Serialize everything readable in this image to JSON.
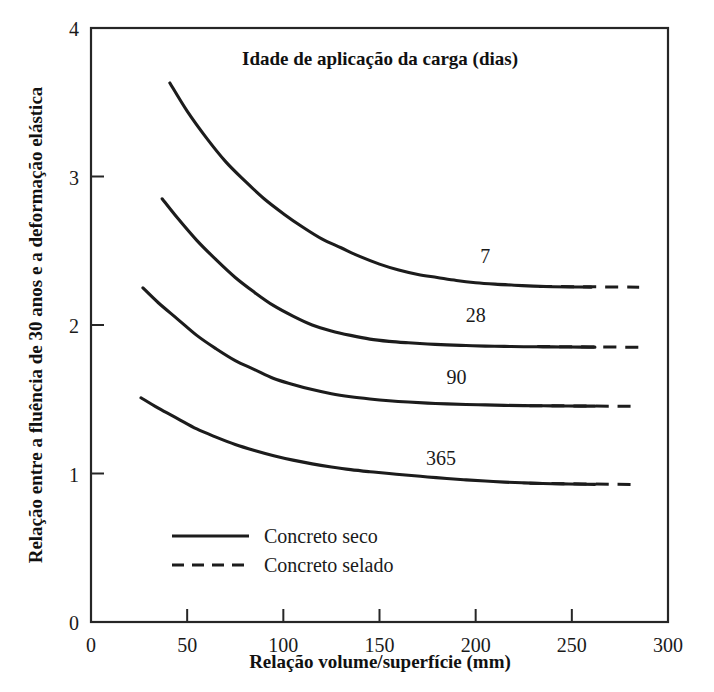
{
  "chart_data": {
    "type": "line",
    "title": "Idade de aplicação da carga (dias)",
    "xlabel": "Relação volume/superfície (mm)",
    "ylabel": "Relação entre a fluência de 30 anos e a deformação elástica",
    "xlim": [
      0,
      300
    ],
    "ylim": [
      0,
      4
    ],
    "xticks": [
      0,
      50,
      100,
      150,
      200,
      250,
      300
    ],
    "xticklabels": [
      "0",
      "50",
      "100",
      "150",
      "200",
      "250",
      "300"
    ],
    "yticks": [
      0,
      1,
      2,
      3,
      4
    ],
    "yticklabels": [
      "0",
      "1",
      "2",
      "3",
      "4"
    ],
    "grid": false,
    "legend_position": "lower-left-inside",
    "legend": [
      {
        "label": "Concreto seco",
        "style": "solid"
      },
      {
        "label": "Concreto selado",
        "style": "dashed"
      }
    ],
    "series": [
      {
        "name": "7",
        "label": "7",
        "label_x": 205,
        "label_y": 2.42,
        "style": "solid-then-dashed",
        "solid_x": [
          41,
          50,
          60,
          70,
          80,
          90,
          100,
          110,
          120,
          130,
          140,
          150,
          160,
          170,
          180,
          190,
          200,
          210,
          220,
          230,
          240,
          250,
          260
        ],
        "solid_y": [
          3.63,
          3.44,
          3.26,
          3.1,
          2.97,
          2.85,
          2.75,
          2.66,
          2.58,
          2.52,
          2.46,
          2.41,
          2.37,
          2.34,
          2.32,
          2.3,
          2.285,
          2.275,
          2.268,
          2.262,
          2.258,
          2.256,
          2.255
        ],
        "dashed_x": [
          233,
          285
        ],
        "dashed_y": [
          2.26,
          2.255
        ]
      },
      {
        "name": "28",
        "label": "28",
        "label_x": 200,
        "label_y": 2.02,
        "style": "solid-then-dashed",
        "solid_x": [
          37,
          45,
          55,
          65,
          75,
          85,
          95,
          105,
          115,
          125,
          135,
          145,
          155,
          165,
          175,
          185,
          195,
          205,
          215,
          225,
          235,
          245,
          255,
          262
        ],
        "solid_y": [
          2.85,
          2.72,
          2.57,
          2.44,
          2.32,
          2.22,
          2.13,
          2.06,
          2.0,
          1.96,
          1.93,
          1.905,
          1.89,
          1.88,
          1.872,
          1.866,
          1.862,
          1.858,
          1.856,
          1.854,
          1.853,
          1.852,
          1.851,
          1.851
        ],
        "dashed_x": [
          232,
          286
        ],
        "dashed_y": [
          1.855,
          1.85
        ]
      },
      {
        "name": "90",
        "label": "90",
        "label_x": 190,
        "label_y": 1.6,
        "style": "solid-then-dashed",
        "solid_x": [
          27,
          35,
          45,
          55,
          65,
          75,
          85,
          95,
          105,
          115,
          125,
          135,
          145,
          155,
          165,
          175,
          185,
          195,
          205,
          215,
          225,
          235,
          245,
          255,
          262
        ],
        "solid_y": [
          2.25,
          2.15,
          2.04,
          1.93,
          1.84,
          1.76,
          1.7,
          1.64,
          1.6,
          1.565,
          1.537,
          1.517,
          1.502,
          1.49,
          1.481,
          1.474,
          1.469,
          1.465,
          1.462,
          1.459,
          1.457,
          1.456,
          1.455,
          1.454,
          1.454
        ],
        "dashed_x": [
          228,
          285
        ],
        "dashed_y": [
          1.457,
          1.452
        ]
      },
      {
        "name": "365",
        "label": "365",
        "label_x": 182,
        "label_y": 1.06,
        "style": "solid-then-dashed",
        "solid_x": [
          26,
          35,
          45,
          55,
          65,
          75,
          85,
          95,
          105,
          115,
          125,
          135,
          145,
          155,
          165,
          175,
          185,
          195,
          205,
          215,
          225,
          235,
          245,
          255,
          262
        ],
        "solid_y": [
          1.51,
          1.44,
          1.37,
          1.3,
          1.245,
          1.195,
          1.155,
          1.12,
          1.09,
          1.065,
          1.044,
          1.026,
          1.012,
          1.0,
          0.988,
          0.977,
          0.966,
          0.957,
          0.949,
          0.942,
          0.937,
          0.933,
          0.93,
          0.928,
          0.927
        ],
        "dashed_x": [
          228,
          285
        ],
        "dashed_y": [
          0.934,
          0.925
        ]
      }
    ]
  }
}
